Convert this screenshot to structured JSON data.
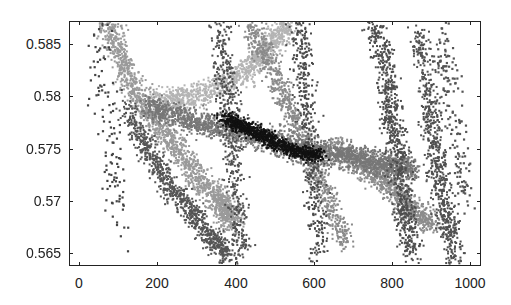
{
  "chart_data": {
    "type": "scatter",
    "title": "",
    "xlabel": "",
    "ylabel": "",
    "xlim": [
      -25,
      1028
    ],
    "ylim": [
      0.5638,
      0.5872
    ],
    "grid": false,
    "legend": null,
    "colormap": "grayscale (light gray = low density/value, black = high)",
    "xticks": [
      0,
      200,
      400,
      600,
      800,
      1000
    ],
    "xtick_labels": [
      "0",
      "200",
      "400",
      "600",
      "800",
      "1000"
    ],
    "yticks": [
      0.565,
      0.57,
      0.575,
      0.58,
      0.585
    ],
    "ytick_labels": [
      "0.565",
      "0.57",
      "0.575",
      "0.58",
      "0.585"
    ],
    "clusters": [
      {
        "name": "left-descending-band-light",
        "shade": "#9a9a9a",
        "path_x": [
          75,
          130,
          200,
          280,
          360,
          400
        ],
        "path_y": [
          0.587,
          0.5815,
          0.5775,
          0.5735,
          0.57,
          0.568
        ],
        "spread": 0.0015,
        "count": 1600
      },
      {
        "name": "left-descending-band-dark-edge",
        "shade": "#555555",
        "path_x": [
          120,
          175,
          230,
          290,
          340,
          390
        ],
        "path_y": [
          0.579,
          0.575,
          0.5715,
          0.569,
          0.5665,
          0.5645
        ],
        "spread": 0.001,
        "count": 900
      },
      {
        "name": "sparse-left-outliers",
        "shade": "#444444",
        "path_x": [
          40,
          80,
          110
        ],
        "path_y": [
          0.586,
          0.578,
          0.567
        ],
        "spread": 0.006,
        "count": 120
      },
      {
        "name": "upper-rising-band-light",
        "shade": "#b4b4b4",
        "path_x": [
          200,
          300,
          420,
          480,
          540
        ],
        "path_y": [
          0.5795,
          0.58,
          0.582,
          0.5845,
          0.587
        ],
        "spread": 0.0012,
        "count": 1100
      },
      {
        "name": "central-diagonal-gray",
        "shade": "#777777",
        "path_x": [
          180,
          300,
          420,
          540,
          660,
          760,
          860
        ],
        "path_y": [
          0.579,
          0.5775,
          0.5765,
          0.5752,
          0.5745,
          0.5738,
          0.573
        ],
        "spread": 0.0012,
        "count": 2200
      },
      {
        "name": "dark-core",
        "shade": "#111111",
        "path_x": [
          370,
          420,
          470,
          520,
          570,
          610
        ],
        "path_y": [
          0.578,
          0.5772,
          0.5762,
          0.5753,
          0.5746,
          0.5744
        ],
        "spread": 0.0006,
        "count": 900
      },
      {
        "name": "middle-descending-band",
        "shade": "#8a8a8a",
        "path_x": [
          440,
          500,
          560,
          620,
          680
        ],
        "path_y": [
          0.587,
          0.582,
          0.577,
          0.572,
          0.566
        ],
        "spread": 0.0012,
        "count": 900
      },
      {
        "name": "column-near-400",
        "shade": "#505050",
        "path_x": [
          360,
          380,
          400,
          420
        ],
        "path_y": [
          0.587,
          0.58,
          0.572,
          0.565
        ],
        "spread": 0.0015,
        "count": 500
      },
      {
        "name": "column-near-600",
        "shade": "#4a4a4a",
        "path_x": [
          560,
          580,
          600,
          620
        ],
        "path_y": [
          0.587,
          0.58,
          0.572,
          0.5645
        ],
        "spread": 0.0015,
        "count": 450
      },
      {
        "name": "right-gray-band",
        "shade": "#8c8c8c",
        "path_x": [
          650,
          720,
          780,
          820,
          860,
          900
        ],
        "path_y": [
          0.5755,
          0.5735,
          0.572,
          0.5705,
          0.569,
          0.568
        ],
        "spread": 0.0012,
        "count": 900
      },
      {
        "name": "column-near-800",
        "shade": "#4e4e4e",
        "path_x": [
          760,
          790,
          810,
          830,
          850
        ],
        "path_y": [
          0.587,
          0.581,
          0.576,
          0.57,
          0.565
        ],
        "spread": 0.0015,
        "count": 800
      },
      {
        "name": "column-near-920",
        "shade": "#505050",
        "path_x": [
          870,
          900,
          920,
          940,
          960
        ],
        "path_y": [
          0.586,
          0.579,
          0.573,
          0.568,
          0.5648
        ],
        "spread": 0.0014,
        "count": 700
      },
      {
        "name": "right-sparse-column",
        "shade": "#555555",
        "path_x": [
          930,
          960,
          990
        ],
        "path_y": [
          0.587,
          0.578,
          0.57
        ],
        "spread": 0.0025,
        "count": 160
      }
    ]
  }
}
